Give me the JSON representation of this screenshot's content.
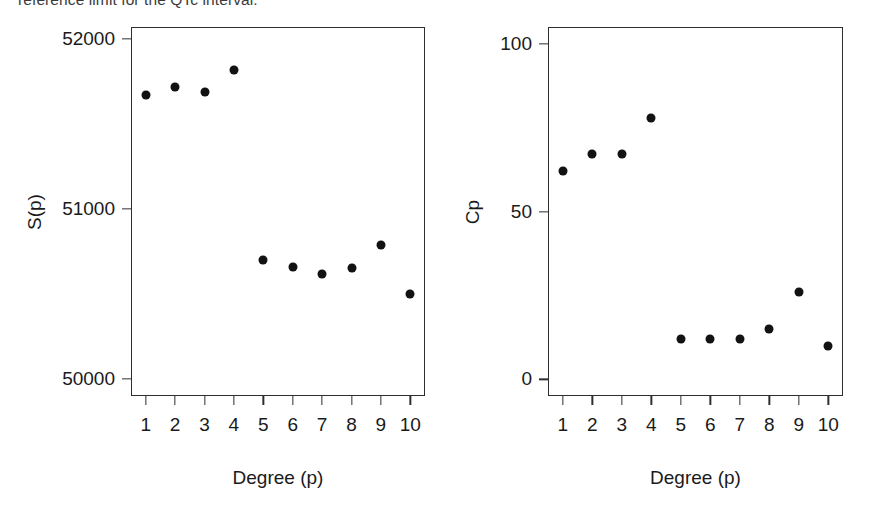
{
  "caption": {
    "clipped_text": "reference limit for the QTc interval."
  },
  "chart_data": [
    {
      "type": "scatter",
      "panel": "left",
      "title": "",
      "xlabel": "Degree (p)",
      "ylabel": "S(p)",
      "x": [
        1,
        2,
        3,
        4,
        5,
        6,
        7,
        8,
        9,
        10
      ],
      "values": [
        51670,
        51720,
        51690,
        51820,
        50700,
        50660,
        50620,
        50650,
        50790,
        50500
      ],
      "xticklabels": [
        "1",
        "2",
        "3",
        "4",
        "5",
        "6",
        "7",
        "8",
        "9",
        "10"
      ],
      "yticklabels": [
        "50000",
        "51000",
        "52000"
      ],
      "ytickvalues": [
        50000,
        51000,
        52000
      ],
      "xlim": [
        0.5,
        10.5
      ],
      "ylim": [
        49900,
        52070
      ],
      "grid": false,
      "legend": "none",
      "marker": "filled-circle",
      "marker_color": "#121212"
    },
    {
      "type": "scatter",
      "panel": "right",
      "title": "",
      "xlabel": "Degree (p)",
      "ylabel": "Cp",
      "x": [
        1,
        2,
        3,
        4,
        5,
        6,
        7,
        8,
        9,
        10
      ],
      "values": [
        62,
        67,
        67,
        78,
        12,
        12,
        12,
        15,
        26,
        10
      ],
      "xticklabels": [
        "1",
        "2",
        "3",
        "4",
        "5",
        "6",
        "7",
        "8",
        "9",
        "10"
      ],
      "yticklabels": [
        "0",
        "50",
        "100"
      ],
      "ytickvalues": [
        0,
        50,
        100
      ],
      "xlim": [
        0.5,
        10.5
      ],
      "ylim": [
        -5,
        105
      ],
      "grid": false,
      "legend": "none",
      "marker": "filled-circle",
      "marker_color": "#121212"
    }
  ]
}
